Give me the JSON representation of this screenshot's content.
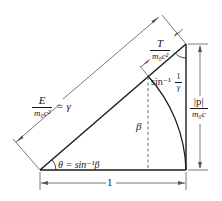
{
  "diagram": {
    "type": "geometric-relativity-triangle",
    "colors": {
      "line": "#1a1a1a",
      "dimension": "#555555",
      "background": "#ffffff"
    },
    "labels": {
      "energy": {
        "numerator": "E",
        "denominator": "m₀c²",
        "suffix": "= γ"
      },
      "kinetic": {
        "numerator": "T",
        "denominator": "m₀c²"
      },
      "momentum": {
        "numerator": "|p|",
        "denominator": "m₀c"
      },
      "base": "1",
      "beta": "β",
      "theta": "θ = sin⁻¹β",
      "top_angle_prefix": "sin⁻¹",
      "top_angle_num": "1",
      "top_angle_den": "γ"
    },
    "geometry": {
      "origin": [
        40,
        170
      ],
      "base_end": [
        186,
        170
      ],
      "apex": [
        186,
        44
      ],
      "arc_radius": 146,
      "arc_hypotenuse_point": [
        148,
        76
      ]
    }
  }
}
